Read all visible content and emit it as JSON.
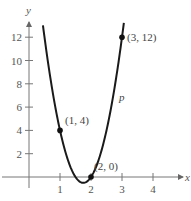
{
  "chart_data": {
    "type": "line",
    "title": "",
    "xlabel": "x",
    "ylabel": "y",
    "xlim": [
      -0.9,
      4.9
    ],
    "ylim": [
      -1.5,
      13.5
    ],
    "grid": false,
    "x_ticks": [
      1,
      2,
      3,
      4
    ],
    "y_ticks": [
      2,
      4,
      6,
      8,
      10,
      12
    ],
    "x_tick_labels": [
      "1",
      "2",
      "3",
      "4"
    ],
    "y_tick_labels": [
      "2",
      "4",
      "6",
      "8",
      "10",
      "12"
    ],
    "series": [
      {
        "name": "p",
        "kind": "parabola",
        "equation": "y = 8x^2 - 28x + 24",
        "x_range": [
          0.45,
          3.06
        ],
        "color": "#1a1a1a"
      }
    ],
    "points": [
      {
        "x": 1,
        "y": 4,
        "label": "(1, 4)"
      },
      {
        "x": 2,
        "y": 0,
        "label": "(2, 0)"
      },
      {
        "x": 3,
        "y": 12,
        "label": "(3, 12)"
      }
    ],
    "curve_label": "p"
  }
}
